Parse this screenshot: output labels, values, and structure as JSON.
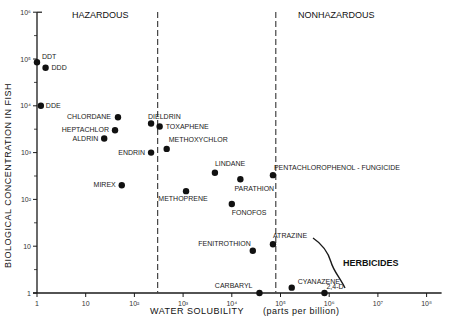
{
  "chart_data": {
    "type": "scatter",
    "title": "",
    "xlabel": "WATER SOLUBILITY (parts per billion)",
    "ylabel": "BIOLOGICAL CONCENTRATION IN FISH",
    "xscale": "log",
    "yscale": "log",
    "xlim": [
      1,
      100000000
    ],
    "ylim": [
      1,
      1000000
    ],
    "grid": false,
    "x_tick_labels": [
      "1",
      "10",
      "10²",
      "10³",
      "10⁴",
      "10⁵",
      "10⁶",
      "10⁷",
      "10⁸"
    ],
    "y_tick_labels": [
      "1",
      "10",
      "10²",
      "10³",
      "10⁴",
      "10⁵",
      "10⁶"
    ],
    "region_labels": [
      {
        "text": "HAZARDOUS",
        "x_range": [
          1,
          300
        ]
      },
      {
        "text": "NONHAZARDOUS",
        "x_range": [
          80000,
          100000000
        ]
      }
    ],
    "threshold_lines": [
      {
        "x": 300,
        "style": "dashed"
      },
      {
        "x": 80000,
        "style": "dashed"
      }
    ],
    "annotations": [
      {
        "text": "HERBICIDES",
        "note": "curved bracket grouping ATRAZINE, CYANAZENE, 2,4-D"
      }
    ],
    "points": [
      {
        "label": "DDT",
        "x": 1,
        "y": 85000
      },
      {
        "label": "DDD",
        "x": 1.5,
        "y": 65000
      },
      {
        "label": "DDE",
        "x": 1.2,
        "y": 10000
      },
      {
        "label": "CHLORDANE",
        "x": 46,
        "y": 5700
      },
      {
        "label": "HEPTACHLOR",
        "x": 40,
        "y": 3000
      },
      {
        "label": "ALDRIN",
        "x": 24,
        "y": 2000
      },
      {
        "label": "DIELDRIN",
        "x": 220,
        "y": 4200
      },
      {
        "label": "TOXAPHENE",
        "x": 330,
        "y": 3600
      },
      {
        "label": "ENDRIN",
        "x": 220,
        "y": 1000
      },
      {
        "label": "METHOXYCHLOR",
        "x": 460,
        "y": 1200
      },
      {
        "label": "MIREX",
        "x": 55,
        "y": 200
      },
      {
        "label": "METHOPRENE",
        "x": 1150,
        "y": 150
      },
      {
        "label": "LINDANE",
        "x": 4500,
        "y": 370
      },
      {
        "label": "PARATHION",
        "x": 15000,
        "y": 270
      },
      {
        "label": "PENTACHLOROPHENOL - FUNGICIDE",
        "x": 70000,
        "y": 330
      },
      {
        "label": "FONOFOS",
        "x": 10000,
        "y": 80
      },
      {
        "label": "FENITROTHION",
        "x": 27000,
        "y": 8
      },
      {
        "label": "ATRAZINE",
        "x": 70000,
        "y": 11
      },
      {
        "label": "CARBARYL",
        "x": 37000,
        "y": 1
      },
      {
        "label": "CYANAZENE",
        "x": 170000,
        "y": 1.3
      },
      {
        "label": "2,4-D",
        "x": 800000,
        "y": 1
      }
    ]
  },
  "labels": {
    "hazardous": "HAZARDOUS",
    "nonhazardous": "NONHAZARDOUS",
    "herbicides": "HERBICIDES",
    "xlabel_main": "WATER   SOLUBILITY",
    "xlabel_units": "(parts  per  billion)",
    "ylabel": "BIOLOGICAL  CONCENTRATION  IN  FISH"
  }
}
